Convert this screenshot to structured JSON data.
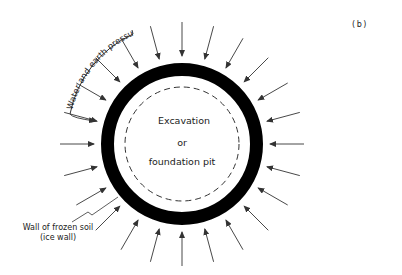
{
  "figure": {
    "panel_label": "(b)",
    "center_labels": [
      "Excavation",
      "or",
      "foundation pit"
    ],
    "pressure_label": "Water and earth pressure",
    "wall_label_line1": "Wall of frozen soil",
    "wall_label_line2": "(ice wall)"
  },
  "geometry": {
    "center": [
      182,
      144
    ],
    "ring_outer_radius": 81,
    "ring_thickness": 13,
    "dashed_circle_radius": 57,
    "arrow_count": 24,
    "arrow_outer_radius": 122,
    "arrow_inner_radius": 88
  },
  "colors": {
    "ring": "#000000",
    "arrow": "#333333",
    "text": "#222222"
  }
}
